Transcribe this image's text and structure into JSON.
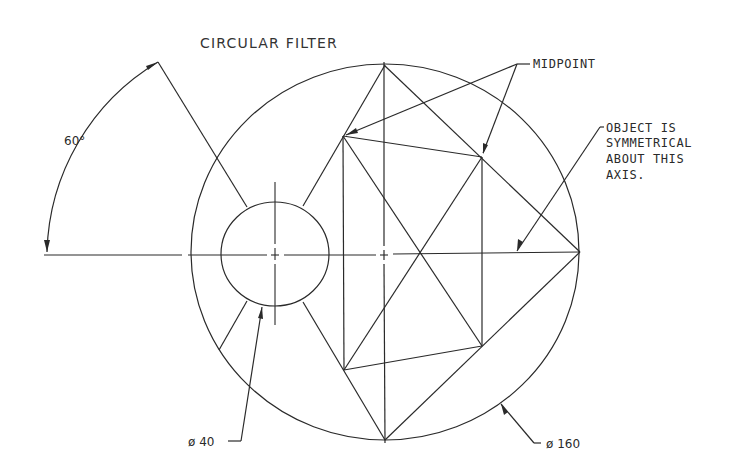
{
  "drawing": {
    "title": "CIRCULAR FILTER",
    "angle_label": "60°",
    "midpoint_label": "MIDPOINT",
    "symmetry_note": {
      "line1": "OBJECT IS",
      "line2": "SYMMETRICAL",
      "line3": "ABOUT THIS",
      "line4": "AXIS."
    },
    "small_diameter_label": "ø 40",
    "large_diameter_label": "ø 160",
    "colors": {
      "line": "#2a2a2a",
      "background": "#ffffff"
    }
  }
}
